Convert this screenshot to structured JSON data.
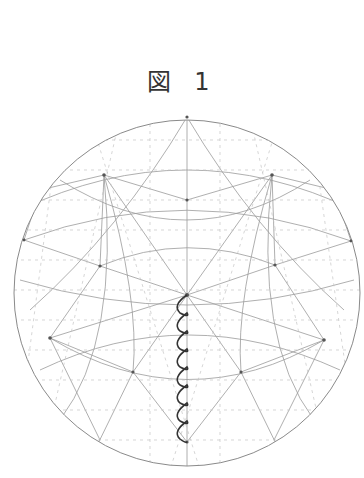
{
  "figure": {
    "title": "図 1"
  },
  "colors": {
    "grid": "#9a9a9a",
    "dashes": "#bdbdbd",
    "zigzag": "#333333"
  }
}
